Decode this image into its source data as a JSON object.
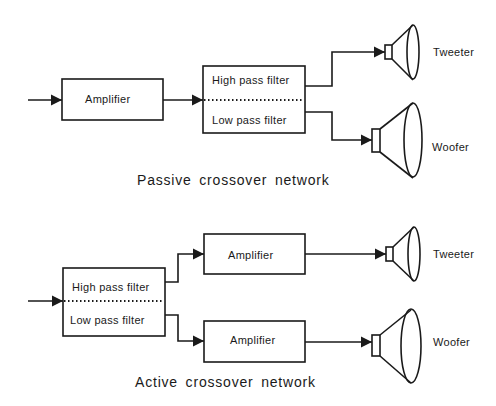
{
  "passive": {
    "title": "Passive crossover network",
    "amplifier": "Amplifier",
    "high_pass": "High pass filter",
    "low_pass": "Low pass filter",
    "tweeter": "Tweeter",
    "woofer": "Woofer"
  },
  "active": {
    "title": "Active crossover network",
    "high_pass": "High pass filter",
    "low_pass": "Low pass filter",
    "amplifier_top": "Amplifier",
    "amplifier_bottom": "Amplifier",
    "tweeter": "Tweeter",
    "woofer": "Woofer"
  },
  "colors": {
    "stroke": "#1a1a1a",
    "background": "#ffffff"
  }
}
